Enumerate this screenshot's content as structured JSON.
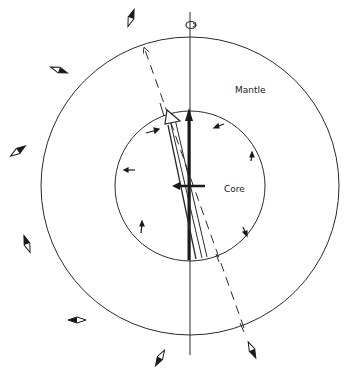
{
  "diagram": {
    "labels": {
      "mantle": "Mantle",
      "core": "Core"
    },
    "colors": {
      "stroke": "#2a2a2a",
      "background": "#ffffff"
    },
    "geometry": {
      "center": [
        190,
        186
      ],
      "outer_radius": 149,
      "inner_radius": 75
    },
    "elements": [
      "outer-circle-mantle",
      "inner-circle-core",
      "rotation-axis",
      "axis-rotation-ellipse",
      "dashed-magnetic-axis-arrow",
      "core-field-vector-bold",
      "open-double-arrow",
      "horizontal-equatorial-arrow",
      "core-flow-arrows",
      "surface-compass-needles"
    ]
  }
}
